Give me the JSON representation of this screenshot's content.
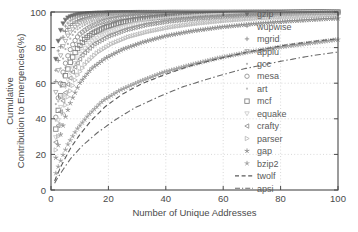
{
  "chart_data": {
    "type": "scatter",
    "title": "",
    "xlabel": "Number of Unique Addresses",
    "ylabel": "Cumulative Contribution to Emergencies(%)",
    "ylabel_line1": "Cumulative",
    "ylabel_line2": "Contribution to Emergencies(%)",
    "xlim": [
      0,
      100
    ],
    "ylim": [
      0,
      100
    ],
    "xticks": [
      0,
      20,
      40,
      60,
      80,
      100
    ],
    "yticks": [
      0,
      20,
      40,
      60,
      80,
      100
    ],
    "xticklabels": [
      "0",
      "20",
      "40",
      "60",
      "80",
      "100"
    ],
    "yticklabels": [
      "0",
      "20",
      "40",
      "60",
      "80",
      "100"
    ],
    "grid": true,
    "grid_style": "dotted",
    "legend_position": "right-inside",
    "legend_frame": false,
    "series": [
      {
        "name": "gzip",
        "marker": "triangle-down",
        "style": "markers",
        "color": "#6e6e6e",
        "x": [
          1,
          2,
          3,
          4,
          5,
          6,
          8,
          10,
          13,
          16,
          20,
          25,
          30,
          36,
          43,
          50,
          58,
          66,
          75,
          85,
          95,
          100
        ],
        "y": [
          62,
          79,
          88,
          93,
          95.5,
          97,
          98.2,
          98.8,
          99.2,
          99.5,
          99.7,
          99.8,
          99.9,
          99.9,
          100,
          100,
          100,
          100,
          100,
          100,
          100,
          100
        ]
      },
      {
        "name": "wupwise",
        "marker": "plus-small",
        "style": "markers",
        "color": "#9a9a9a",
        "x": [
          1,
          2,
          3,
          4,
          5,
          6,
          7,
          9,
          11,
          14,
          17,
          21,
          26,
          32,
          39,
          47,
          56,
          66,
          77,
          88,
          97,
          100
        ],
        "y": [
          55,
          73,
          83,
          89,
          92,
          94,
          95.5,
          97,
          98,
          98.7,
          99.1,
          99.4,
          99.6,
          99.8,
          99.9,
          100,
          100,
          100,
          100,
          100,
          100,
          100
        ]
      },
      {
        "name": "mgrid",
        "marker": "plus",
        "style": "markers",
        "color": "#8a8a8a",
        "x": [
          1,
          2,
          3,
          4,
          5,
          7,
          9,
          11,
          14,
          18,
          22,
          27,
          33,
          40,
          48,
          57,
          67,
          78,
          89,
          97,
          100
        ],
        "y": [
          48,
          67,
          78,
          85,
          89,
          93,
          95,
          96.4,
          97.6,
          98.4,
          99,
          99.4,
          99.6,
          99.8,
          99.9,
          100,
          100,
          100,
          100,
          100,
          100
        ]
      },
      {
        "name": "applu",
        "marker": "triangle-down-open",
        "style": "markers",
        "color": "#a8a8a8",
        "x": [
          1,
          2,
          3,
          4,
          6,
          8,
          10,
          13,
          16,
          20,
          25,
          31,
          38,
          46,
          55,
          65,
          76,
          87,
          96,
          100
        ],
        "y": [
          42,
          61,
          73,
          80,
          87,
          91,
          93.5,
          95.5,
          96.8,
          97.8,
          98.5,
          99,
          99.4,
          99.6,
          99.8,
          99.9,
          100,
          100,
          100,
          100
        ]
      },
      {
        "name": "gcc",
        "marker": "dot",
        "style": "markers",
        "color": "#b4b4b4",
        "x": [
          1,
          2,
          3,
          5,
          7,
          9,
          12,
          15,
          19,
          24,
          30,
          37,
          45,
          54,
          64,
          75,
          86,
          95,
          100
        ],
        "y": [
          36,
          54,
          66,
          79,
          86,
          90,
          93,
          95,
          96.5,
          97.6,
          98.4,
          99,
          99.3,
          99.6,
          99.8,
          99.9,
          100,
          100,
          100
        ]
      },
      {
        "name": "mesa",
        "marker": "circle-open",
        "style": "markers",
        "color": "#8e8e8e",
        "x": [
          1,
          2,
          3,
          4,
          5,
          6,
          7,
          8,
          9,
          10,
          12,
          14,
          17,
          20,
          24,
          29,
          35,
          42,
          50,
          60,
          70,
          82,
          94,
          100
        ],
        "y": [
          30,
          46,
          57,
          65,
          71,
          76,
          80,
          83,
          85.5,
          87.5,
          90,
          92,
          94,
          95.4,
          96.6,
          97.5,
          98.3,
          98.9,
          99.3,
          99.6,
          99.8,
          99.9,
          100,
          100
        ]
      },
      {
        "name": "art",
        "marker": "dot-light",
        "style": "markers",
        "color": "#c0c0c0",
        "x": [
          1,
          2,
          3,
          4,
          6,
          8,
          11,
          14,
          18,
          23,
          29,
          36,
          44,
          53,
          63,
          74,
          86,
          96,
          100
        ],
        "y": [
          28,
          44,
          55,
          63,
          74,
          80,
          86,
          89,
          92,
          94,
          95.8,
          97,
          98,
          98.6,
          99.1,
          99.5,
          99.8,
          100,
          100
        ]
      },
      {
        "name": "mcf",
        "marker": "square-open",
        "style": "markers",
        "color": "#7e7e7e",
        "x": [
          1,
          2,
          3,
          4,
          5,
          7,
          9,
          12,
          15,
          19,
          24,
          30,
          37,
          45,
          55,
          66,
          78,
          90,
          98,
          100
        ],
        "y": [
          24,
          39,
          50,
          58,
          64,
          73,
          79,
          85,
          88.5,
          91.5,
          94,
          95.8,
          97,
          98,
          98.7,
          99.2,
          99.6,
          99.9,
          100,
          100
        ]
      },
      {
        "name": "equake",
        "marker": "triangle-down-light",
        "style": "markers",
        "color": "#cacaca",
        "x": [
          1,
          2,
          3,
          5,
          7,
          10,
          13,
          17,
          22,
          28,
          35,
          43,
          52,
          62,
          73,
          85,
          96,
          100
        ],
        "y": [
          20,
          34,
          44,
          58,
          67,
          76,
          82,
          86.5,
          90,
          92.8,
          95,
          96.5,
          97.6,
          98.4,
          99,
          99.5,
          99.9,
          100
        ]
      },
      {
        "name": "crafty",
        "marker": "triangle-left",
        "style": "markers",
        "color": "#909090",
        "x": [
          1,
          2,
          3,
          4,
          6,
          8,
          11,
          15,
          20,
          26,
          33,
          41,
          50,
          60,
          71,
          83,
          95,
          100
        ],
        "y": [
          18,
          31,
          41,
          49,
          60,
          68,
          76,
          82,
          86.5,
          90,
          92.8,
          94.8,
          96.3,
          97.4,
          98.3,
          99,
          99.6,
          99.8
        ]
      },
      {
        "name": "parser",
        "marker": "triangle-right-open",
        "style": "markers",
        "color": "#b8b8b8",
        "x": [
          1,
          2,
          4,
          6,
          9,
          12,
          16,
          21,
          27,
          34,
          42,
          51,
          61,
          72,
          84,
          95,
          100
        ],
        "y": [
          15,
          26,
          42,
          53,
          64,
          71,
          77,
          82,
          86,
          89,
          91.6,
          93.6,
          95.2,
          96.5,
          97.5,
          98.3,
          98.6
        ]
      },
      {
        "name": "gap",
        "marker": "star",
        "style": "markers",
        "color": "#8c8c8c",
        "x": [
          1,
          2,
          3,
          5,
          7,
          10,
          14,
          19,
          25,
          32,
          40,
          49,
          59,
          70,
          82,
          94,
          100
        ],
        "y": [
          12,
          21,
          29,
          41,
          50,
          60,
          68,
          74,
          79,
          83,
          86.5,
          89.2,
          91.4,
          93.2,
          94.7,
          95.9,
          96.4
        ]
      },
      {
        "name": "bzip2",
        "marker": "star-filled",
        "style": "markers",
        "color": "#a0a0a0",
        "x": [
          1,
          2,
          4,
          6,
          9,
          13,
          18,
          24,
          31,
          39,
          48,
          58,
          69,
          81,
          93,
          100
        ],
        "y": [
          6,
          11,
          19,
          26,
          34,
          42,
          50,
          56,
          61,
          66,
          70,
          74,
          77.5,
          80.5,
          83,
          84.5
        ]
      },
      {
        "name": "twolf",
        "marker": "none",
        "style": "dashed",
        "color": "#5a5a5a",
        "x": [
          1,
          2,
          4,
          7,
          10,
          14,
          19,
          25,
          32,
          40,
          49,
          59,
          70,
          82,
          94,
          100
        ],
        "y": [
          4,
          8,
          15,
          24,
          31,
          39,
          47,
          54,
          60,
          65,
          70,
          74,
          78,
          81.5,
          84,
          85
        ]
      },
      {
        "name": "apsi",
        "marker": "none",
        "style": "dashdot",
        "color": "#6a6a6a",
        "x": [
          1,
          2,
          4,
          7,
          11,
          16,
          22,
          29,
          37,
          46,
          56,
          67,
          79,
          91,
          100
        ],
        "y": [
          3,
          6,
          11,
          18,
          25,
          32,
          39,
          46,
          52,
          58,
          63,
          68,
          72,
          75.5,
          77.5
        ]
      }
    ]
  },
  "legend": {
    "entries": [
      {
        "label": "gzip"
      },
      {
        "label": "wupwise"
      },
      {
        "label": "mgrid"
      },
      {
        "label": "applu"
      },
      {
        "label": "gcc"
      },
      {
        "label": "mesa"
      },
      {
        "label": "art"
      },
      {
        "label": "mcf"
      },
      {
        "label": "equake"
      },
      {
        "label": "crafty"
      },
      {
        "label": "parser"
      },
      {
        "label": "gap"
      },
      {
        "label": "bzip2"
      },
      {
        "label": "twolf"
      },
      {
        "label": "apsi"
      }
    ]
  },
  "colors": {
    "background": "#ffffff",
    "axis": "#4a4a4a",
    "grid": "#c8c8c8",
    "text": "#4a4a4a"
  }
}
